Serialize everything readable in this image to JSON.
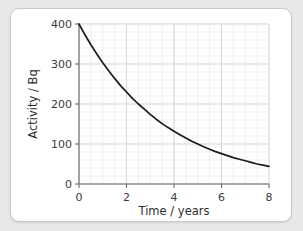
{
  "chart_data": {
    "type": "line",
    "title": "",
    "xlabel": "Time / years",
    "ylabel": "Activity / Bq",
    "xlim": [
      0,
      8
    ],
    "ylim": [
      0,
      400
    ],
    "xticks": [
      0,
      2,
      4,
      6,
      8
    ],
    "xtick_labels": [
      "0",
      "2",
      "4",
      "6",
      "8"
    ],
    "yticks": [
      0,
      100,
      200,
      300,
      400
    ],
    "ytick_labels": [
      "0",
      "100",
      "200",
      "300",
      "400"
    ],
    "grid": true,
    "grid_minor_x_step": 0.5,
    "grid_minor_y_step": 20,
    "grid_major_x_step": 2,
    "grid_major_y_step": 100,
    "legend": false,
    "series": [
      {
        "name": "Activity",
        "initial_value": 400,
        "half_life_years": 2.27,
        "x": [
          0,
          0.25,
          0.5,
          0.75,
          1,
          1.25,
          1.5,
          1.75,
          2,
          2.25,
          2.5,
          2.75,
          3,
          3.25,
          3.5,
          3.75,
          4,
          4.25,
          4.5,
          4.75,
          5,
          5.25,
          5.5,
          5.75,
          6,
          6.25,
          6.5,
          6.75,
          7,
          7.25,
          7.5,
          7.75,
          8
        ],
        "y": [
          400,
          373,
          348,
          325,
          303,
          283,
          264,
          246,
          230,
          214,
          200,
          187,
          174,
          162,
          151,
          141,
          132,
          123,
          115,
          107,
          100,
          93,
          87,
          81,
          76,
          71,
          66,
          62,
          58,
          54,
          50,
          47,
          44
        ]
      }
    ],
    "curve_color": "#1b1b1b",
    "grid_minor_color": "#e9e9ef",
    "grid_major_color": "#cfcfda",
    "axis_color": "#6a6a6a",
    "card_background": "#ffffff",
    "page_background": "#e8e8e6"
  }
}
